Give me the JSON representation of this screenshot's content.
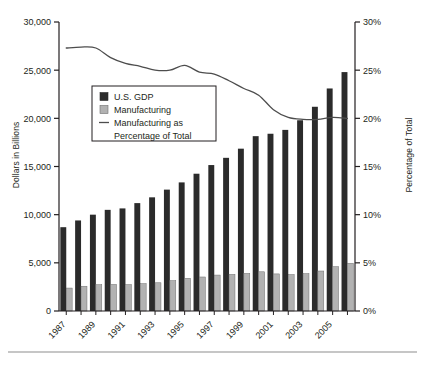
{
  "chart_data": {
    "type": "bar",
    "title": "",
    "xlabel": "",
    "ylabel": "Dollars in Billions",
    "y2label": "Percentage of Total",
    "ylim": [
      0,
      30000
    ],
    "y2lim": [
      0,
      30
    ],
    "grid": false,
    "legend_position": "upper-left-inside",
    "x": [
      1987,
      1988,
      1989,
      1990,
      1991,
      1992,
      1993,
      1994,
      1995,
      1996,
      1997,
      1998,
      1999,
      2000,
      2001,
      2002,
      2003,
      2004,
      2005,
      2006
    ],
    "categories": [
      "1987",
      "1988",
      "1989",
      "1990",
      "1991",
      "1992",
      "1993",
      "1994",
      "1995",
      "1996",
      "1997",
      "1998",
      "1999",
      "2000",
      "2001",
      "2002",
      "2003",
      "2004",
      "2005",
      "2006"
    ],
    "xtick_labels": [
      "1987",
      "1989",
      "1991",
      "1993",
      "1995",
      "1997",
      "1999",
      "2001",
      "2003",
      "2005"
    ],
    "ytick_labels": [
      "0",
      "5,000",
      "10,000",
      "15,000",
      "20,000",
      "25,000",
      "30,000"
    ],
    "ytick_values": [
      0,
      5000,
      10000,
      15000,
      20000,
      25000,
      30000
    ],
    "y2tick_labels": [
      "0%",
      "5%",
      "10%",
      "15%",
      "20%",
      "25%",
      "30%"
    ],
    "y2tick_values": [
      0,
      5,
      10,
      15,
      20,
      25,
      30
    ],
    "series": [
      {
        "name": "U.S. GDP",
        "kind": "bar",
        "color": "#2b2b2b",
        "axis": "left",
        "values": [
          8700,
          9400,
          10000,
          10500,
          10650,
          11200,
          11800,
          12600,
          13350,
          14250,
          15150,
          15900,
          16850,
          18150,
          18400,
          18800,
          19800,
          21200,
          23100,
          24800
        ]
      },
      {
        "name": "Manufacturing",
        "kind": "bar",
        "color": "#b2b2b2",
        "axis": "left",
        "values": [
          2380,
          2570,
          2730,
          2760,
          2740,
          2840,
          2930,
          3150,
          3400,
          3530,
          3730,
          3800,
          3900,
          4070,
          3850,
          3780,
          3880,
          4150,
          4600,
          4950
        ]
      },
      {
        "name": "Manufacturing as Percentage of Total",
        "kind": "line",
        "color": "#4d4d4d",
        "axis": "right",
        "values": [
          27.3,
          27.4,
          27.3,
          26.3,
          25.7,
          25.4,
          25.0,
          25.0,
          25.5,
          24.8,
          24.6,
          23.9,
          23.1,
          22.4,
          20.9,
          20.1,
          19.9,
          19.9,
          20.1,
          20.0
        ]
      }
    ],
    "legend": [
      {
        "label": "U.S. GDP",
        "marker": "square",
        "color": "#2b2b2b"
      },
      {
        "label": "Manufacturing",
        "marker": "square",
        "color": "#b2b2b2"
      },
      {
        "label": "Manufacturing as",
        "label2": "Percentage of Total",
        "marker": "line",
        "color": "#4d4d4d"
      }
    ]
  }
}
